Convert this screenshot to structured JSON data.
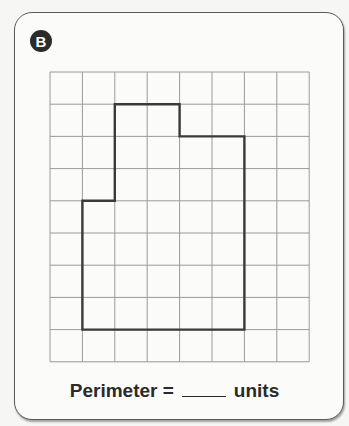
{
  "badge": {
    "label": "B"
  },
  "grid": {
    "columns": 8,
    "rows": 9,
    "origin_px": [
      50,
      72
    ],
    "cell_px": [
      32.4,
      32.2
    ],
    "line_color": "#9a9a9a",
    "shape_color": "#3a3a3a",
    "shape_vertices_grid": [
      [
        2,
        1
      ],
      [
        4,
        1
      ],
      [
        4,
        2
      ],
      [
        6,
        2
      ],
      [
        6,
        8
      ],
      [
        1,
        8
      ],
      [
        1,
        4
      ],
      [
        2,
        4
      ]
    ]
  },
  "caption": {
    "prefix": "Perimeter =",
    "blank": "",
    "suffix": "units"
  }
}
